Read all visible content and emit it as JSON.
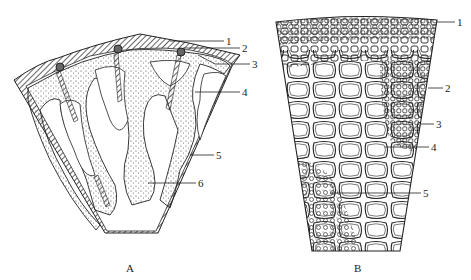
{
  "figure": {
    "panels": [
      {
        "id": "A",
        "label": "A",
        "callouts": [
          "1",
          "2",
          "3",
          "4",
          "5",
          "6"
        ]
      },
      {
        "id": "B",
        "label": "B",
        "callouts": [
          "1",
          "2",
          "3",
          "4",
          "5"
        ]
      }
    ]
  },
  "panelA": {
    "label": "A",
    "callouts": {
      "c1": "1",
      "c2": "2",
      "c3": "3",
      "c4": "4",
      "c5": "5",
      "c6": "6"
    }
  },
  "panelB": {
    "label": "B",
    "callouts": {
      "c1": "1",
      "c2": "2",
      "c3": "3",
      "c4": "4",
      "c5": "5"
    }
  },
  "colors": {
    "ink": "#222222",
    "stipple": "#555555",
    "background": "#ffffff"
  }
}
